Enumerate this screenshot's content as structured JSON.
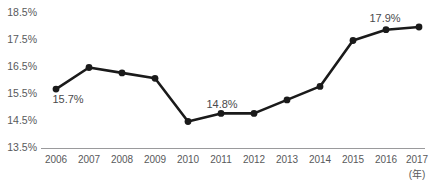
{
  "chart_data": {
    "type": "line",
    "title": "",
    "subtitle": "",
    "xlabel": "(年)",
    "ylabel": "",
    "categories": [
      "2006",
      "2007",
      "2008",
      "2009",
      "2010",
      "2011",
      "2012",
      "2013",
      "2014",
      "2015",
      "2016",
      "2017"
    ],
    "values": [
      15.7,
      16.5,
      16.3,
      16.1,
      14.5,
      14.8,
      14.8,
      15.3,
      15.8,
      17.5,
      17.9,
      18.0
    ],
    "series": [
      {
        "name": "",
        "values": [
          15.7,
          16.5,
          16.3,
          16.1,
          14.5,
          14.8,
          14.8,
          15.3,
          15.8,
          17.5,
          17.9,
          18.0
        ]
      }
    ],
    "ylim": [
      13.5,
      18.5
    ],
    "ytick_values": [
      13.5,
      14.5,
      15.5,
      16.5,
      17.5,
      18.5
    ],
    "ytick_labels": [
      "13.5%",
      "14.5%",
      "15.5%",
      "16.5%",
      "17.5%",
      "18.5%"
    ],
    "xtick_labels": [
      "2006",
      "2007",
      "2008",
      "2009",
      "2010",
      "2011",
      "2012",
      "2013",
      "2014",
      "2015",
      "2016",
      "2017"
    ],
    "grid": false,
    "legend": false,
    "legend_position": "none",
    "data_labels": [
      {
        "category": "2006",
        "text": "15.7%",
        "position": "below"
      },
      {
        "category": "2011",
        "text": "14.8%",
        "position": "above"
      },
      {
        "category": "2016",
        "text": "17.9%",
        "position": "above"
      }
    ],
    "colors": {
      "line": "#1a1a1a",
      "marker": "#1a1a1a",
      "axis": "#9a9a9c",
      "tick_text": "#58595b",
      "label_text": "#4a4a4c",
      "background": "#ffffff"
    }
  },
  "axis": {
    "y_labels": {
      "t0": "13.5%",
      "t1": "14.5%",
      "t2": "15.5%",
      "t3": "16.5%",
      "t4": "17.5%",
      "t5": "18.5%"
    },
    "x_labels": {
      "c0": "2006",
      "c1": "2007",
      "c2": "2008",
      "c3": "2009",
      "c4": "2010",
      "c5": "2011",
      "c6": "2012",
      "c7": "2013",
      "c8": "2014",
      "c9": "2015",
      "c10": "2016",
      "c11": "2017"
    },
    "unit": "(年)"
  },
  "labels": {
    "first": "15.7%",
    "middle": "14.8%",
    "late": "17.9%"
  }
}
